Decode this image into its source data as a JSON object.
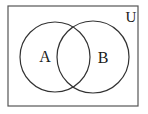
{
  "diagram": {
    "type": "venn",
    "universe": {
      "label": "U",
      "x": 8,
      "y": 6,
      "width": 130,
      "height": 100,
      "stroke": "#555555"
    },
    "sets": [
      {
        "label": "A",
        "cx": 55,
        "cy": 57,
        "r": 35,
        "label_x": 45,
        "label_y": 62
      },
      {
        "label": "B",
        "cx": 93,
        "cy": 57,
        "r": 36,
        "label_x": 103,
        "label_y": 63
      }
    ],
    "universe_label_pos": {
      "x": 131,
      "y": 22
    },
    "stroke_color": "#333333",
    "background": "#ffffff"
  }
}
